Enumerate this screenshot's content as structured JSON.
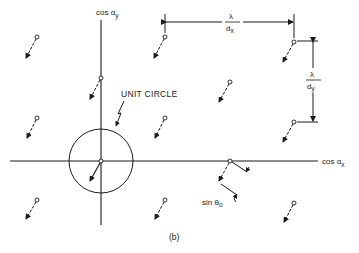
{
  "figure": {
    "caption": "(b)",
    "stroke_color": "#1a1a1a",
    "background": "#ffffff"
  },
  "axes": {
    "x_label_main": "cos α",
    "x_label_sub": "x",
    "y_label_main": "cos α",
    "y_label_sub": "y",
    "origin": [
      101,
      161
    ]
  },
  "unit_circle": {
    "label": "UNIT CIRCLE",
    "center": [
      101,
      161
    ],
    "radius": 32
  },
  "spacing": {
    "horizontal": {
      "numerator": "λ",
      "denominator": "d",
      "denominator_sub": "x"
    },
    "vertical": {
      "numerator": "λ",
      "denominator": "d",
      "denominator_sub": "y"
    }
  },
  "scan": {
    "label": "sin θ",
    "label_sub": "o"
  },
  "grating_lobes": [
    {
      "x": 37,
      "y": 37
    },
    {
      "x": 165,
      "y": 37
    },
    {
      "x": 294,
      "y": 42
    },
    {
      "x": 101,
      "y": 78
    },
    {
      "x": 230,
      "y": 82
    },
    {
      "x": 37,
      "y": 118
    },
    {
      "x": 165,
      "y": 118
    },
    {
      "x": 294,
      "y": 122
    },
    {
      "x": 101,
      "y": 161
    },
    {
      "x": 230,
      "y": 161
    },
    {
      "x": 37,
      "y": 200
    },
    {
      "x": 165,
      "y": 200
    },
    {
      "x": 294,
      "y": 203
    }
  ]
}
